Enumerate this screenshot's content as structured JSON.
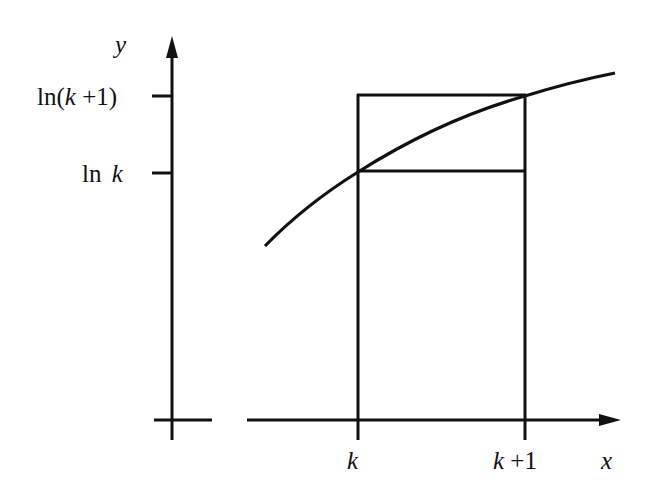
{
  "diagram": {
    "axes": {
      "x_label": "x",
      "y_label": "y"
    },
    "y_ticks": [
      {
        "id": "ln_k_plus_1",
        "text_prefix": "ln(",
        "var": "k",
        "text_suffix": " +1)"
      },
      {
        "id": "ln_k",
        "text_prefix": "ln ",
        "var": "k",
        "text_suffix": ""
      }
    ],
    "x_ticks": [
      {
        "id": "k",
        "var": "k",
        "text_suffix": ""
      },
      {
        "id": "k_plus_1",
        "var": "k",
        "text_suffix": " +1"
      }
    ],
    "curve": "y = ln x",
    "colors": {
      "stroke": "#111111",
      "background": "#ffffff"
    }
  }
}
